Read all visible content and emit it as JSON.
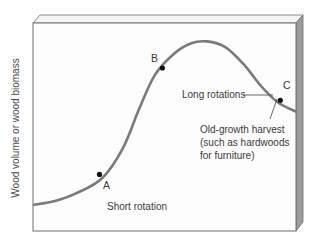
{
  "chart_data": {
    "type": "line",
    "title": "",
    "xlabel": "",
    "ylabel": "Wood volume or wood biomass",
    "grid": false,
    "legend": "none",
    "x_range": [
      0,
      100
    ],
    "y_range": [
      0,
      100
    ],
    "series": [
      {
        "name": "Growth curve",
        "color": "#7a7a7a",
        "points": [
          {
            "x": 0,
            "y": 8
          },
          {
            "x": 8,
            "y": 10
          },
          {
            "x": 16,
            "y": 14
          },
          {
            "x": 26,
            "y": 22
          },
          {
            "x": 34,
            "y": 38
          },
          {
            "x": 40,
            "y": 58
          },
          {
            "x": 46,
            "y": 76
          },
          {
            "x": 53,
            "y": 87
          },
          {
            "x": 60,
            "y": 93
          },
          {
            "x": 66,
            "y": 94
          },
          {
            "x": 73,
            "y": 91
          },
          {
            "x": 80,
            "y": 82
          },
          {
            "x": 87,
            "y": 70
          },
          {
            "x": 93,
            "y": 62
          },
          {
            "x": 100,
            "y": 57
          }
        ]
      }
    ],
    "marked_points": [
      {
        "label": "A",
        "x": 25,
        "y": 24
      },
      {
        "label": "B",
        "x": 49,
        "y": 80
      },
      {
        "label": "C",
        "x": 94,
        "y": 63
      }
    ],
    "annotations": [
      {
        "id": "short-rotation",
        "text": "Short rotation"
      },
      {
        "id": "long-rotations",
        "text": "Long rotations"
      },
      {
        "id": "old-growth",
        "lines": [
          "Old-growth harvest",
          "(such as hardwoods",
          "for furniture)"
        ]
      }
    ]
  },
  "colors": {
    "curve": "#7a7a7a",
    "point": "#111111",
    "frame": "#6e6e6e",
    "front_face": "#fdfdfd",
    "top_face": "#f4f4f4",
    "side_face": "#9c9c9c",
    "leader": "#555555"
  }
}
